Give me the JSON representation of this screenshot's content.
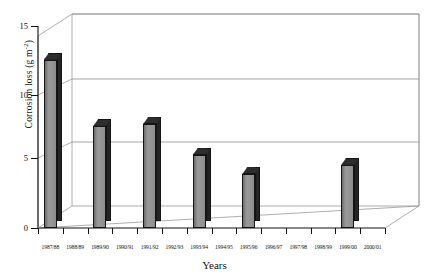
{
  "chart_data": {
    "type": "bar",
    "title": "",
    "xlabel": "Years",
    "ylabel_text": "Corrosion loss (g m",
    "ylabel_sup": "-2",
    "ylabel_tail": ")",
    "ylabel_full": "Corrosion loss (g m-2)",
    "categories": [
      "1987/88",
      "1988/89",
      "1989/90",
      "1990/91",
      "1991/92",
      "1992/93",
      "1993/94",
      "1994/95",
      "1995/96",
      "1996/97",
      "1997/98",
      "1998/99",
      "1999/00",
      "2000/01"
    ],
    "values": [
      12.5,
      null,
      7.6,
      null,
      7.7,
      null,
      5.4,
      null,
      4.0,
      null,
      null,
      null,
      4.7,
      null
    ],
    "ylim": [
      0,
      15
    ],
    "yticks": [
      0,
      5,
      10,
      15
    ],
    "ytick_labels": [
      "0",
      "5",
      "10",
      "15"
    ],
    "grid": true,
    "legend": "none",
    "style": "3d-column",
    "colors": {
      "bar_front": "#8a8a8a",
      "bar_side": "#242424",
      "bar_top": "#2d2d2d",
      "axis": "#111111",
      "grid": "#8f8f8f",
      "background": "#ffffff"
    }
  }
}
